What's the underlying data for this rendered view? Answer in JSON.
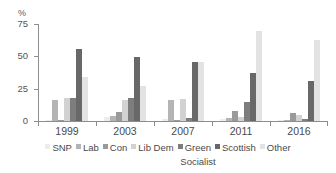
{
  "chart_data": {
    "type": "bar",
    "title": "",
    "subtitle": "",
    "xlabel": "",
    "ylabel": "%",
    "ylim": [
      0,
      75
    ],
    "yticks": [
      0,
      25,
      50,
      75
    ],
    "ytick_labels": [
      "0",
      "25",
      "50",
      "75"
    ],
    "grid": false,
    "legend_position": "bottom",
    "categories": [
      "1999",
      "2003",
      "2007",
      "2011",
      "2016"
    ],
    "series": [
      {
        "name": "SNP",
        "color": "#ededed",
        "values": [
          0.8,
          2.9,
          1.6,
          1.8,
          0.4
        ]
      },
      {
        "name": "Lab",
        "color": "#b4b4b4",
        "values": [
          16.5,
          4.1,
          16.2,
          2.0,
          0.6
        ]
      },
      {
        "name": "Con",
        "color": "#9a9a9a",
        "values": [
          0.9,
          6.7,
          1.0,
          7.6,
          5.9
        ]
      },
      {
        "name": "Lib Dem",
        "color": "#d2d2d2",
        "values": [
          17.6,
          16.3,
          16.7,
          3.1,
          4.9
        ]
      },
      {
        "name": "Green",
        "color": "#7d7d7d",
        "values": [
          17.6,
          17.6,
          2.0,
          14.6,
          1.2
        ]
      },
      {
        "name": "Scottish Socialist",
        "color": "#686868",
        "values": [
          55.5,
          49.8,
          45.3,
          37.0,
          31.3
        ]
      },
      {
        "name": "Other",
        "color": "#e3e3e3",
        "values": [
          34.2,
          26.9,
          45.7,
          69.4,
          62.4
        ]
      }
    ]
  },
  "axis": {
    "y_title": "%",
    "y_ticks": [
      "75",
      "50",
      "25",
      "0"
    ],
    "x_labels": [
      "1999",
      "2003",
      "2007",
      "2011",
      "2016"
    ]
  },
  "legend": {
    "line1": [
      {
        "label": "SNP",
        "color": "#ededed"
      },
      {
        "label": "Lab",
        "color": "#b4b4b4"
      },
      {
        "label": "Con",
        "color": "#9a9a9a"
      },
      {
        "label": "Lib Dem",
        "color": "#d2d2d2"
      },
      {
        "label": "Green",
        "color": "#7d7d7d"
      },
      {
        "label": "Scottish",
        "color": "#686868"
      },
      {
        "label": "Other",
        "color": "#e3e3e3"
      }
    ],
    "line2": "Socialist"
  }
}
